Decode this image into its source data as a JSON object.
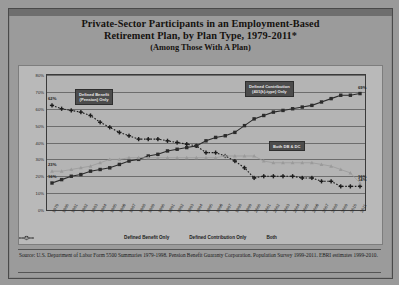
{
  "title": {
    "line1": "Private-Sector Participants in an Employment-Based",
    "line2": "Retirement Plan, by Plan Type, 1979-2011*",
    "line3": "(Among Those With A Plan)"
  },
  "annotations": {
    "db": "Defined Benefit\n(Pension) Only",
    "dc": "Defined Contribution\n(401(k)-type) Only",
    "both": "Both DB & DC"
  },
  "source": "Source: U.S. Department of Labor Form 5500 Summaries 1979-1998. Pension Benefit Guaranty Corporation. Population Survey 1999-2011. EBRI estimates 1999-2010.",
  "chart_data": {
    "type": "line",
    "title": "Private-Sector Participants in an Employment-Based Retirement Plan, by Plan Type, 1979-2011*",
    "subtitle": "(Among Those With A Plan)",
    "xlabel": "",
    "ylabel": "",
    "ylim": [
      0,
      80
    ],
    "yticks": [
      0,
      10,
      20,
      30,
      40,
      50,
      60,
      70,
      80
    ],
    "ytick_labels": [
      "0%",
      "10%",
      "20%",
      "30%",
      "40%",
      "50%",
      "60%",
      "70%",
      "80%"
    ],
    "grid": true,
    "legend_position": "bottom",
    "categories": [
      "1979",
      "1980",
      "1981",
      "1982",
      "1983",
      "1984",
      "1985",
      "1986",
      "1987",
      "1988",
      "1989",
      "1990",
      "1991",
      "1992",
      "1993",
      "1994",
      "1995",
      "1996",
      "1997",
      "1998",
      "1999",
      "2000",
      "2001",
      "2002",
      "2003",
      "2004",
      "2005",
      "2006",
      "2007",
      "2008",
      "2009",
      "2010",
      "2011"
    ],
    "series": [
      {
        "name": "Defined Benefit Only",
        "marker": "plus",
        "style": "dotted",
        "color": "#1c1c1c",
        "values": [
          62,
          60,
          59,
          58,
          56,
          52,
          49,
          46,
          44,
          42,
          42,
          42,
          41,
          40,
          39,
          38,
          34,
          34,
          32,
          29,
          25,
          19,
          20,
          20,
          20,
          20,
          19,
          19,
          17,
          17,
          14,
          14,
          14
        ],
        "start_label": "62%",
        "end_label": "14%"
      },
      {
        "name": "Defined Contribution Only",
        "marker": "square",
        "style": "solid",
        "color": "#2b2b2b",
        "values": [
          16,
          18,
          20,
          21,
          23,
          24,
          25,
          27,
          29,
          30,
          32,
          33,
          35,
          36,
          37,
          38,
          41,
          43,
          44,
          46,
          50,
          54,
          56,
          58,
          59,
          60,
          61,
          62,
          64,
          66,
          68,
          68,
          69
        ],
        "start_label": "16%",
        "end_label": "69%"
      },
      {
        "name": "Both",
        "marker": "triangle",
        "style": "solid-light",
        "color": "#9a9a9a",
        "values": [
          23,
          23,
          24,
          25,
          26,
          28,
          30,
          30,
          31,
          31,
          31,
          31,
          31,
          31,
          31,
          31,
          31,
          31,
          32,
          32,
          32,
          32,
          29,
          28,
          28,
          28,
          28,
          28,
          27,
          26,
          24,
          22,
          16
        ],
        "start_label": "23%",
        "end_label": "16%"
      }
    ]
  }
}
